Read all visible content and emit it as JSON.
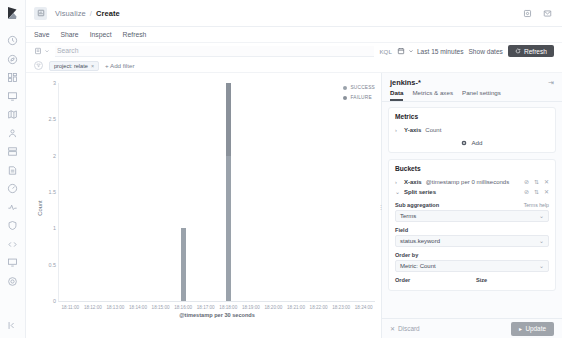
{
  "app": {
    "breadcrumb_root": "Visualize",
    "breadcrumb_current": "Create"
  },
  "rail": {
    "icons": [
      {
        "name": "recently-viewed-icon",
        "glyph": "clock"
      },
      {
        "name": "discover-icon",
        "glyph": "compass"
      },
      {
        "name": "dashboard-icon",
        "glyph": "dashboard"
      },
      {
        "name": "canvas-icon",
        "glyph": "canvas"
      },
      {
        "name": "maps-icon",
        "glyph": "map"
      },
      {
        "name": "machine-learning-icon",
        "glyph": "ml"
      },
      {
        "name": "infrastructure-icon",
        "glyph": "infra"
      },
      {
        "name": "logs-icon",
        "glyph": "logs"
      },
      {
        "name": "apm-icon",
        "glyph": "apm"
      },
      {
        "name": "uptime-icon",
        "glyph": "uptime"
      },
      {
        "name": "siem-icon",
        "glyph": "siem"
      },
      {
        "name": "dev-tools-icon",
        "glyph": "devtools"
      },
      {
        "name": "monitoring-icon",
        "glyph": "monitor"
      },
      {
        "name": "management-icon",
        "glyph": "gear"
      }
    ],
    "collapse_label": "collapse-nav-icon"
  },
  "header": {
    "settings_icon": "gear-icon",
    "help_icon": "help-icon"
  },
  "appmenu": {
    "items": [
      {
        "label": "Save",
        "name": "menu-save"
      },
      {
        "label": "Share",
        "name": "menu-share"
      },
      {
        "label": "Inspect",
        "name": "menu-inspect"
      },
      {
        "label": "Refresh",
        "name": "menu-refresh"
      }
    ]
  },
  "querybar": {
    "search_placeholder": "Search",
    "search_value": "",
    "language": "KQL",
    "date_range": "Last 15 minutes",
    "show_dates": "Show dates",
    "refresh_label": "Refresh"
  },
  "filterbar": {
    "filter_pill": "project: relate",
    "pill_remove": "×",
    "add_filter": "+ Add filter"
  },
  "chart": {
    "legend_position": "right",
    "colors": {
      "success": "#9aa2ab",
      "failure": "#8a919a"
    }
  },
  "editor": {
    "index_pattern": "jenkins-*",
    "collapse_icon": "collapse-panel-icon",
    "tabs": [
      {
        "label": "Data",
        "name": "tab-data",
        "active": true
      },
      {
        "label": "Metrics & axes",
        "name": "tab-metrics-axes",
        "active": false
      },
      {
        "label": "Panel settings",
        "name": "tab-panel-settings",
        "active": false
      }
    ],
    "metrics": {
      "title": "Metrics",
      "rows": [
        {
          "prefix": "Y-axis",
          "rest": "Count"
        }
      ],
      "add_label": "Add"
    },
    "buckets": {
      "title": "Buckets",
      "rows": [
        {
          "prefix": "X-axis",
          "rest": "@timestamp per 0 milliseconds"
        },
        {
          "prefix": "Split series",
          "rest": ""
        }
      ]
    },
    "split_series": {
      "sub_agg_label": "Sub aggregation",
      "terms_help": "Terms help",
      "sub_agg_value": "Terms",
      "field_label": "Field",
      "field_value": "status.keyword",
      "order_by_label": "Order by",
      "order_by_value": "Metric: Count",
      "order_label": "Order",
      "size_label": "Size"
    },
    "footer": {
      "discard_label": "Discard",
      "update_label": "Update"
    }
  },
  "chart_data": {
    "type": "bar",
    "title": "",
    "stacked": true,
    "xlabel": "@timestamp per 30 seconds",
    "ylabel": "Count",
    "ylim": [
      0,
      3
    ],
    "yticks": [
      0,
      0.5,
      1,
      1.5,
      2,
      2.5,
      3
    ],
    "ytick_labels": [
      "0",
      "0.5",
      "1",
      "1.5",
      "2",
      "2.5",
      "3"
    ],
    "grid": false,
    "legend": [
      "SUCCESS",
      "FAILURE"
    ],
    "categories": [
      "18:11:00",
      "18:12:00",
      "18:13:00",
      "18:14:00",
      "18:15:00",
      "18:16:00",
      "18:17:00",
      "18:18:00",
      "18:19:00",
      "18:20:00",
      "18:21:00",
      "18:22:00",
      "18:23:00",
      "18:24:00"
    ],
    "series": [
      {
        "name": "SUCCESS",
        "color": "#9aa2ab",
        "values": [
          0,
          0,
          0,
          0,
          0,
          1,
          0,
          2,
          0,
          0,
          0,
          0,
          0,
          0
        ]
      },
      {
        "name": "FAILURE",
        "color": "#8a919a",
        "values": [
          0,
          0,
          0,
          0,
          0,
          0,
          0,
          1,
          0,
          0,
          0,
          0,
          0,
          0
        ]
      }
    ],
    "bars": [
      {
        "x_index": 5,
        "x_label": "18:16:00",
        "success": 1,
        "failure": 0,
        "total": 1
      },
      {
        "x_index": 7,
        "x_label": "18:18:00",
        "success": 2,
        "failure": 1,
        "total": 3
      }
    ]
  }
}
